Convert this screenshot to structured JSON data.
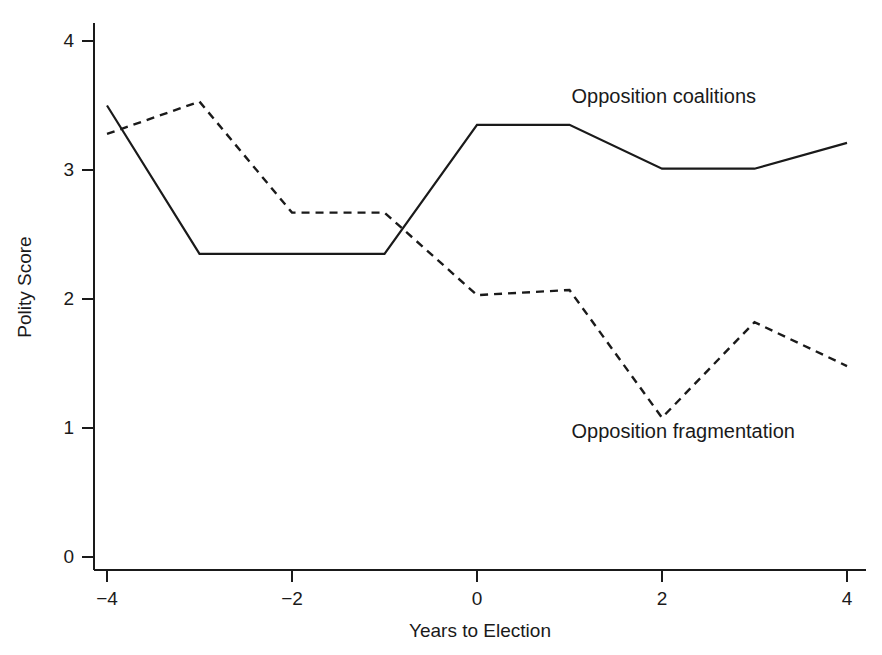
{
  "chart_data": {
    "type": "line",
    "title": "",
    "xlabel": "Years to Election",
    "ylabel": "Polity Score",
    "xlim": [
      -4,
      4
    ],
    "ylim": [
      0,
      4
    ],
    "xticks": [
      "-4",
      "-2",
      "0",
      "2",
      "4"
    ],
    "xtick_values": [
      -4,
      -2,
      0,
      2,
      4
    ],
    "yticks": [
      "0",
      "1",
      "2",
      "3",
      "4"
    ],
    "ytick_values": [
      0,
      1,
      2,
      3,
      4
    ],
    "grid": false,
    "legend_position": "inline-annotations",
    "x": [
      -4,
      -3,
      -2,
      -1,
      0,
      1,
      2,
      3,
      4
    ],
    "series": [
      {
        "name": "Opposition coalitions",
        "style": "solid",
        "color": "#1a1a1a",
        "values": [
          3.5,
          2.35,
          2.35,
          2.35,
          3.35,
          3.35,
          3.01,
          3.01,
          3.21
        ]
      },
      {
        "name": "Opposition fragmentation",
        "style": "dashed",
        "color": "#1a1a1a",
        "values": [
          3.28,
          3.53,
          2.67,
          2.67,
          2.03,
          2.07,
          1.08,
          1.82,
          1.48
        ]
      }
    ],
    "annotations": [
      {
        "text": "Opposition coalitions",
        "x": 1.0,
        "y": 3.55
      },
      {
        "text": "Opposition fragmentation",
        "x": 1.0,
        "y": 0.95
      }
    ]
  }
}
